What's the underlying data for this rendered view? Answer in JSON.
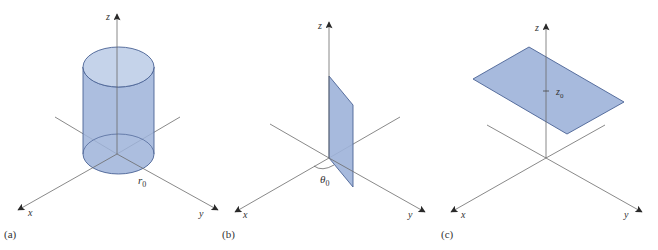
{
  "figure": {
    "colors": {
      "surface_fill": "#9db3d9",
      "surface_fill_light": "#c5d3ea",
      "surface_edge": "#4a6294",
      "axis": "#6b6b6b",
      "text": "#333333"
    },
    "panels": [
      {
        "id": "a",
        "label": "(a)",
        "surface": "cylinder",
        "param_label": "r",
        "param_sub": "0",
        "axes": {
          "x": "x",
          "y": "y",
          "z": "z"
        }
      },
      {
        "id": "b",
        "label": "(b)",
        "surface": "half-plane",
        "param_label": "θ",
        "param_sub": "0",
        "axes": {
          "x": "x",
          "y": "y",
          "z": "z"
        }
      },
      {
        "id": "c",
        "label": "(c)",
        "surface": "horizontal plane",
        "param_label": "z",
        "param_sub": "0",
        "axes": {
          "x": "x",
          "y": "y",
          "z": "z"
        }
      }
    ]
  }
}
